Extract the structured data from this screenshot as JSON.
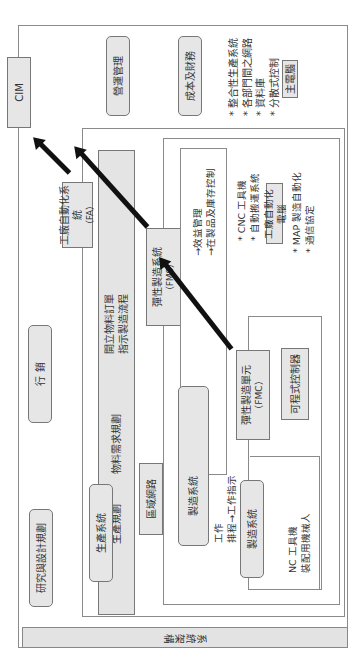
{
  "orientation": "rotated 90 degrees counter-clockwise",
  "footer_strip": {
    "label": "系統架構"
  },
  "cim": {
    "label": "CIM"
  },
  "top_boxes": [
    {
      "label": "營運管理"
    },
    {
      "label": "成本及財務"
    }
  ],
  "cim_features": {
    "bullets": [
      "* 整合性生產系統",
      "* 各部門間之網路",
      "* 資料庫",
      "* 分散式控制"
    ],
    "computer": "主電腦"
  },
  "fa": {
    "title": "工廠自動化系統",
    "abbr": "（FA）",
    "bar_lines": [
      "開立物料訂單",
      "指示製造流程"
    ],
    "bar_lines_lower": [
      "生產規劃",
      "物料需求規劃"
    ],
    "production_system": "生產系統",
    "lan": "區域網路",
    "marketing": "行 銷",
    "rnd": "研究與設計規劃"
  },
  "fms": {
    "title": "彈性製造系統",
    "abbr": "（FMS）",
    "mgmt_lines": [
      "→效益管理",
      "→在製品及庫存控制"
    ],
    "features": [
      "* CNC 工具機",
      "* 自動搬運系統"
    ],
    "computer": "工廠自動化電腦",
    "protocols": [
      "* MAP 製造自動化",
      "* 通信協定"
    ],
    "manufacturing_system": "製造系統",
    "work_lines": [
      "工作",
      "排程→工作指示"
    ]
  },
  "fmc": {
    "title": "彈性製造單元",
    "abbr": "（FMC）",
    "plc": "可程式控制器",
    "manufacturing_system": "製造系統",
    "machines": [
      "NC 工具機",
      "裝配用機械人"
    ]
  }
}
